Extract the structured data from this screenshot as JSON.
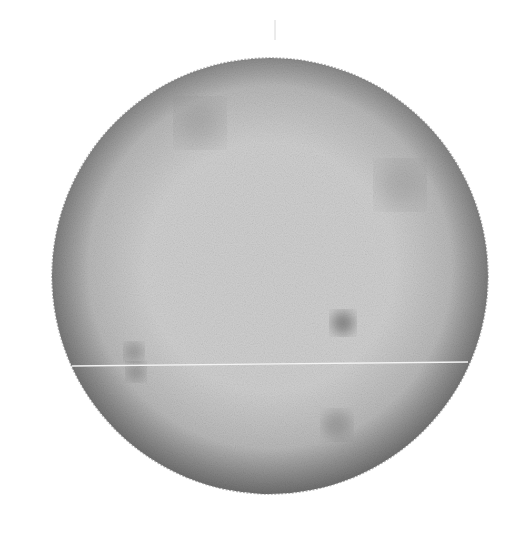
{
  "image": {
    "subject": "solar disk photograph",
    "background_color": "#ffffff",
    "disk": {
      "center_x": 270,
      "center_y": 276,
      "radius": 218,
      "center_color": "#cfcfcf",
      "mid_color": "#b8b8b8",
      "limb_color": "#6e6e6e"
    },
    "spots": [
      {
        "cx": 343,
        "cy": 323,
        "r": 11,
        "opacity": 0.55
      },
      {
        "cx": 134,
        "cy": 352,
        "r": 9,
        "opacity": 0.35
      },
      {
        "cx": 136,
        "cy": 372,
        "r": 9,
        "opacity": 0.35
      },
      {
        "cx": 337,
        "cy": 425,
        "r": 14,
        "opacity": 0.25
      },
      {
        "cx": 200,
        "cy": 123,
        "r": 22,
        "opacity": 0.2
      },
      {
        "cx": 400,
        "cy": 185,
        "r": 22,
        "opacity": 0.2
      }
    ],
    "scan_line": {
      "x1": 72,
      "y1": 366,
      "x2": 468,
      "y2": 362,
      "color": "#f4f4f4"
    },
    "top_tick": {
      "x": 275,
      "y1": 20,
      "y2": 40,
      "color": "#d8d8d8"
    }
  }
}
